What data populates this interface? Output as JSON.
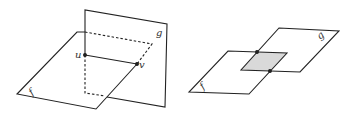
{
  "figures": [
    {
      "name": "perpendicular-planes",
      "labels": {
        "plane1": "f",
        "plane2": "g",
        "point1": "u",
        "point2": "v"
      }
    },
    {
      "name": "overlapping-planes",
      "labels": {
        "plane1": "f",
        "plane2": "g"
      }
    }
  ],
  "colors": {
    "stroke": "#222222",
    "overlap_fill": "#d9d9d9"
  }
}
